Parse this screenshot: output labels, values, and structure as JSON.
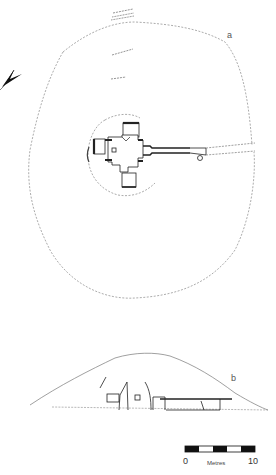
{
  "figure": {
    "plan_label": "a",
    "section_label": "b"
  },
  "scale_bar": {
    "start_label": "0",
    "end_label": "10",
    "unit_label": "Metres",
    "segments": 5,
    "colors": [
      "#111111",
      "#ffffff",
      "#111111",
      "#ffffff",
      "#111111"
    ]
  },
  "north_arrow": {
    "icon": "north-arrow-icon"
  },
  "colors": {
    "line": "#222222",
    "dashed_outline": "#888888",
    "background": "#ffffff"
  }
}
